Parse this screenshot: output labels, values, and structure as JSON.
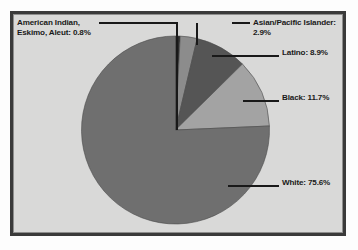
{
  "figure": {
    "background_color": "#d9d9d8",
    "frame_color": "#3a3a3a"
  },
  "chart_data": {
    "type": "pie",
    "title": "",
    "subtitle": "",
    "xlabel": "",
    "ylabel": "",
    "legend_position": "callout-labels",
    "grid": false,
    "start_angle_deg": 0,
    "direction": "clockwise",
    "categories": [
      "American Indian, Eskimo, Aleut",
      "Asian/Pacific Islander",
      "Latino",
      "Black",
      "White"
    ],
    "values": [
      0.8,
      2.9,
      8.9,
      11.7,
      75.6
    ],
    "units": "percent",
    "colors": [
      "#2b2b2b",
      "#8c8c8c",
      "#555555",
      "#a3a3a3",
      "#6f6f6f"
    ],
    "slices": [
      {
        "name": "American Indian, Eskimo, Aleut",
        "value": 0.8,
        "label": "American Indian,\nEskimo, Aleut: 0.8%",
        "color": "#2b2b2b"
      },
      {
        "name": "Asian/Pacific Islander",
        "value": 2.9,
        "label": "Asian/Pacific Islander:\n2.9%",
        "color": "#8c8c8c"
      },
      {
        "name": "Latino",
        "value": 8.9,
        "label": "Latino: 8.9%",
        "color": "#555555"
      },
      {
        "name": "Black",
        "value": 11.7,
        "label": "Black: 11.7%",
        "color": "#a3a3a3"
      },
      {
        "name": "White",
        "value": 75.6,
        "label": "White: 75.6%",
        "color": "#6f6f6f"
      }
    ]
  },
  "labels": {
    "american_indian": "American Indian,\nEskimo, Aleut: 0.8%",
    "asian_pacific_islander": "Asian/Pacific Islander:\n2.9%",
    "latino": "Latino: 8.9%",
    "black": "Black: 11.7%",
    "white": "White: 75.6%"
  }
}
